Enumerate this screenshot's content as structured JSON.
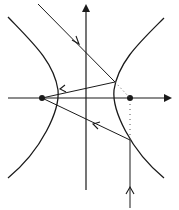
{
  "diagram": {
    "colors": {
      "stroke": "#1a1a1a",
      "dotted": "#555555",
      "background": "#ffffff"
    },
    "elements": {
      "axes": [
        "x-axis",
        "y-axis"
      ],
      "foci": [
        "left-focus",
        "right-focus"
      ],
      "branches": [
        "left-branch",
        "right-branch"
      ],
      "incident_rays": [
        "incident-ray-1",
        "incident-ray-2"
      ],
      "reflected_rays": [
        "reflected-ray-1",
        "reflected-ray-2"
      ],
      "guides": [
        "dotted-guide-1",
        "dotted-guide-2"
      ]
    }
  }
}
